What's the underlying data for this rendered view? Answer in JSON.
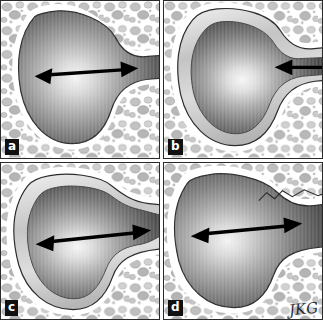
{
  "figure": {
    "caption": "",
    "panel_count": 4,
    "background_color": "#ffffff",
    "border_color": "#2a2a2a",
    "signature": "JKG"
  },
  "legend": {
    "lumen_label": "cyst cavity",
    "bone_label": "trabecular bone",
    "capsule_label": "cyst wall"
  },
  "panels": [
    {
      "id": "panel-a",
      "label": "a",
      "arrow_type": "double-headed",
      "arrow_label": "neck diameter",
      "wall": "thin",
      "neck": "open",
      "description": "Cyst cavity with a thin wall and a broadly patent neck communicating with the adjacent space; double-headed arrow spans the neck."
    },
    {
      "id": "panel-b",
      "label": "b",
      "arrow_type": "single-left",
      "arrow_label": "narrowed neck",
      "wall": "thick",
      "neck": "stenotic",
      "description": "Thickened multilayered cyst wall constricts the neck to a narrow channel; single arrow points to the point of stenosis."
    },
    {
      "id": "panel-c",
      "label": "c",
      "arrow_type": "double-headed",
      "arrow_label": "widened neck",
      "wall": "thick",
      "neck": "wide",
      "description": "Thick-walled cyst with a broadly widened neck; double-headed arrow spans the enlarged communication."
    },
    {
      "id": "panel-d",
      "label": "d",
      "arrow_type": "double-headed",
      "arrow_label": "remodeled neck",
      "wall": "thin",
      "neck": "wide",
      "description": "Thin-walled cyst after remodeling with a wide neck and scalloped bone margins; double-headed arrow spans the neck."
    }
  ],
  "colors": {
    "lumen_light": "#f2f2f2",
    "lumen_mid": "#a9a9a9",
    "lumen_dark": "#4a4a4a",
    "bone_speck": "#b9b9b9",
    "outline": "#2b2b2b",
    "arrow": "#000000",
    "label_bg": "#111111",
    "label_fg": "#ffffff"
  }
}
